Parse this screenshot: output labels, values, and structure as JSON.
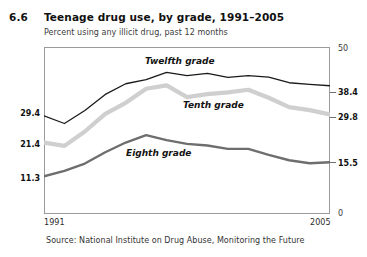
{
  "figure": {
    "number": "6.6",
    "title": "Teenage drug use, by grade, 1991–2005",
    "subtitle": "Percent using any illicit drug, past 12 months",
    "source": "Source: National Institute on Drug Abuse, Monitoring the Future"
  },
  "axis": {
    "x_start_label": "1991",
    "x_end_label": "2005",
    "y_left": {
      "twelfth_start": "29.4",
      "tenth_start": "21.4",
      "eighth_start": "11.3"
    },
    "y_right": {
      "top": "50",
      "twelfth_end": "38.4",
      "tenth_end": "29.8",
      "eighth_end": "15.5",
      "bottom": "0"
    }
  },
  "series_labels": {
    "twelfth": "Twelfth grade",
    "tenth": "Tenth grade",
    "eighth": "Eighth grade"
  },
  "colors": {
    "twelfth": "#1a1a1a",
    "tenth": "#cfcfcf",
    "eighth": "#6e6e6e",
    "frame": "#9a9a9a"
  },
  "chart_data": {
    "type": "line",
    "title": "Teenage drug use, by grade, 1991–2005",
    "subtitle": "Percent using any illicit drug, past 12 months",
    "xlabel": "",
    "ylabel": "Percent using any illicit drug, past 12 months",
    "x": [
      1991,
      1992,
      1993,
      1994,
      1995,
      1996,
      1997,
      1998,
      1999,
      2000,
      2001,
      2002,
      2003,
      2004,
      2005
    ],
    "xlim": [
      1991,
      2005
    ],
    "ylim": [
      0,
      50
    ],
    "grid": false,
    "legend": "inline-labels",
    "series": [
      {
        "name": "Twelfth grade",
        "color": "#1a1a1a",
        "values": [
          29.4,
          27.1,
          31.0,
          35.8,
          39.0,
          40.2,
          42.4,
          41.4,
          42.1,
          40.9,
          41.4,
          41.0,
          39.3,
          38.8,
          38.4
        ],
        "start_label": "29.4",
        "end_label": "38.4"
      },
      {
        "name": "Tenth grade",
        "color": "#cfcfcf",
        "values": [
          21.4,
          20.4,
          24.7,
          30.0,
          33.3,
          37.5,
          38.5,
          35.0,
          35.9,
          36.4,
          37.2,
          34.8,
          32.0,
          31.1,
          29.8
        ],
        "start_label": "21.4",
        "end_label": "29.8"
      },
      {
        "name": "Eighth grade",
        "color": "#6e6e6e",
        "values": [
          11.3,
          12.9,
          15.1,
          18.5,
          21.4,
          23.6,
          22.1,
          21.0,
          20.5,
          19.5,
          19.5,
          17.7,
          16.1,
          15.2,
          15.5
        ],
        "start_label": "11.3",
        "end_label": "15.5"
      }
    ]
  }
}
